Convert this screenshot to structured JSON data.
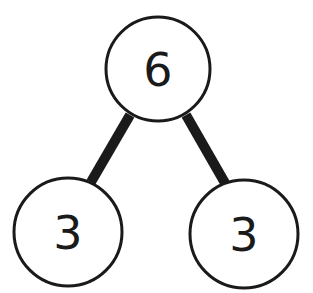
{
  "diagram": {
    "type": "number-bond",
    "whole": "6",
    "parts": [
      "3",
      "3"
    ],
    "colors": {
      "stroke": "#1a1a1a",
      "fill": "#ffffff",
      "text": "#1a1a1a"
    }
  }
}
